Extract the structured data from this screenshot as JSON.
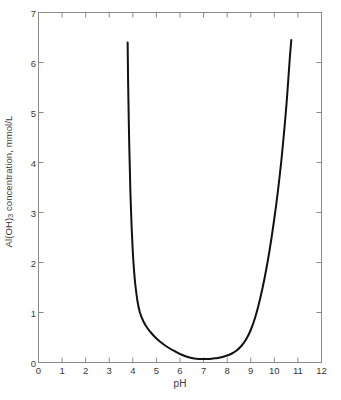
{
  "chart_data": {
    "type": "line",
    "title": "",
    "subtitle": "",
    "xlabel": "pH",
    "ylabel_parts": {
      "prefix": "Al(OH)",
      "subscript": "3",
      "suffix": " concentration, mmol/L"
    },
    "ylabel": "Al(OH)3 concentration, mmol/L",
    "xlim": [
      0,
      12
    ],
    "ylim": [
      0,
      7
    ],
    "xticks": [
      0,
      1,
      2,
      3,
      4,
      5,
      6,
      7,
      8,
      9,
      10,
      11,
      12
    ],
    "yticks": [
      0,
      1,
      2,
      3,
      4,
      5,
      6,
      7
    ],
    "xtick_labels": [
      "0",
      "1",
      "2",
      "3",
      "4",
      "5",
      "6",
      "7",
      "8",
      "9",
      "10",
      "11",
      "12"
    ],
    "ytick_labels": [
      "0",
      "1",
      "2",
      "3",
      "4",
      "5",
      "6",
      "7"
    ],
    "grid": false,
    "legend": null,
    "annotations": [],
    "line_color": "#111111",
    "line_width": 2.0,
    "axis_color": "#8a8a8a",
    "background_color": "#ffffff",
    "tick_direction": "in",
    "frame": "box",
    "series": [
      {
        "name": "Al(OH)3 solubility",
        "x": [
          3.78,
          3.8,
          3.85,
          3.9,
          3.95,
          4.0,
          4.05,
          4.1,
          4.2,
          4.3,
          4.45,
          4.6,
          4.8,
          5.0,
          5.2,
          5.4,
          5.6,
          5.8,
          6.0,
          6.2,
          6.4,
          6.6,
          6.8,
          7.0,
          7.2,
          7.4,
          7.6,
          7.8,
          8.0,
          8.2,
          8.4,
          8.6,
          8.8,
          9.0,
          9.2,
          9.4,
          9.6,
          9.8,
          10.0,
          10.15,
          10.3,
          10.45,
          10.55,
          10.65,
          10.72
        ],
        "y": [
          6.4,
          5.6,
          4.3,
          3.35,
          2.7,
          2.2,
          1.85,
          1.58,
          1.22,
          1.0,
          0.82,
          0.7,
          0.58,
          0.48,
          0.4,
          0.33,
          0.27,
          0.22,
          0.17,
          0.13,
          0.1,
          0.08,
          0.07,
          0.07,
          0.07,
          0.08,
          0.09,
          0.11,
          0.14,
          0.18,
          0.24,
          0.33,
          0.46,
          0.65,
          0.92,
          1.28,
          1.72,
          2.25,
          2.88,
          3.42,
          4.05,
          4.8,
          5.38,
          6.05,
          6.45
        ]
      }
    ]
  }
}
